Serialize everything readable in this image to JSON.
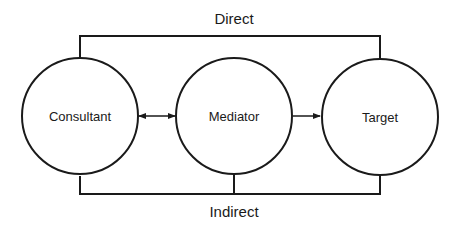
{
  "diagram": {
    "colors": {
      "stroke": "#1a1a1a",
      "background": "#ffffff",
      "fill": "#ffffff"
    },
    "nodes": [
      {
        "id": "consultant",
        "label": "Consultant"
      },
      {
        "id": "mediator",
        "label": "Mediator"
      },
      {
        "id": "target",
        "label": "Target"
      }
    ],
    "edges": [
      {
        "from": "consultant",
        "to": "mediator",
        "type": "bidirectional-arrow"
      },
      {
        "from": "mediator",
        "to": "target",
        "type": "arrow"
      }
    ],
    "paths": {
      "direct": {
        "label": "Direct",
        "connects": [
          "consultant",
          "target"
        ]
      },
      "indirect": {
        "label": "Indirect",
        "connects": [
          "consultant",
          "mediator",
          "target"
        ]
      }
    }
  }
}
